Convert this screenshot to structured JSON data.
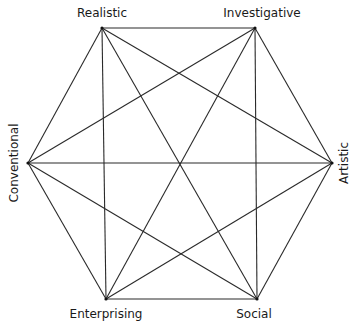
{
  "diagram": {
    "type": "hexagon-complete-graph",
    "line_color": "#2a2a2a",
    "nodes": [
      {
        "id": "realistic",
        "label": "Realistic",
        "x": 102,
        "y": 28
      },
      {
        "id": "investigative",
        "label": "Investigative",
        "x": 255,
        "y": 28
      },
      {
        "id": "artistic",
        "label": "Artistic",
        "x": 332,
        "y": 163
      },
      {
        "id": "social",
        "label": "Social",
        "x": 257,
        "y": 299
      },
      {
        "id": "enterprising",
        "label": "Enterprising",
        "x": 106,
        "y": 299
      },
      {
        "id": "conventional",
        "label": "Conventional",
        "x": 28,
        "y": 163
      }
    ],
    "labels": {
      "realistic": "Realistic",
      "investigative": "Investigative",
      "artistic": "Artistic",
      "social": "Social",
      "enterprising": "Enterprising",
      "conventional": "Conventional"
    },
    "edges": "all pairs (complete graph K6, 15 edges)"
  }
}
